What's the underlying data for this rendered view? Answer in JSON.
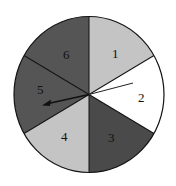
{
  "diagram": {
    "type": "spinner",
    "sections": [
      {
        "label": "1",
        "color": "#c4c4c4"
      },
      {
        "label": "2",
        "color": "#ffffff"
      },
      {
        "label": "3",
        "color": "#4a4a4a"
      },
      {
        "label": "4",
        "color": "#c4c4c4"
      },
      {
        "label": "5",
        "color": "#555555"
      },
      {
        "label": "6",
        "color": "#555555"
      }
    ],
    "pointer_section": "5"
  }
}
